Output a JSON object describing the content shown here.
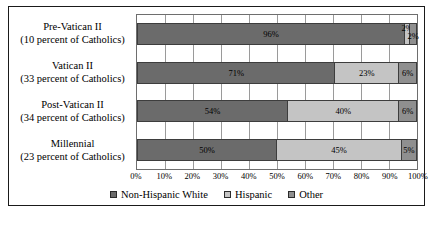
{
  "chart_data": {
    "type": "bar",
    "orientation": "horizontal",
    "stacked": true,
    "normalized_percent": true,
    "title": "",
    "subtitle": "",
    "xlabel": "",
    "ylabel": "",
    "xlim": [
      0,
      100
    ],
    "grid": true,
    "legend_position": "bottom",
    "categories": [
      "Pre-Vatican II",
      "Vatican II",
      "Post-Vatican II",
      "Millennial"
    ],
    "category_sublabels": [
      "(10 percent of Catholics)",
      "(33 percent of Catholics)",
      "(34 percent of Catholics)",
      "(23 percent of Catholics)"
    ],
    "series": [
      {
        "name": "Non-Hispanic White",
        "color": "#6b6b6b",
        "values": [
          96,
          71,
          54,
          50
        ],
        "labels": [
          "96%",
          "71%",
          "54%",
          "50%"
        ]
      },
      {
        "name": "Hispanic",
        "color": "#c4c4c4",
        "values": [
          2,
          23,
          40,
          45
        ],
        "labels": [
          "2%",
          "23%",
          "40%",
          "45%"
        ]
      },
      {
        "name": "Other",
        "color": "#8f8f8f",
        "values": [
          2,
          6,
          6,
          5
        ],
        "labels": [
          "2%",
          "6%",
          "6%",
          "5%"
        ]
      }
    ],
    "xticks": [
      0,
      10,
      20,
      30,
      40,
      50,
      60,
      70,
      80,
      90,
      100
    ],
    "xticklabels": [
      "0%",
      "10%",
      "20%",
      "30%",
      "40%",
      "50%",
      "60%",
      "70%",
      "80%",
      "90%",
      "100%"
    ]
  },
  "legend": {
    "items": [
      {
        "label": "Non-Hispanic White",
        "color": "#6b6b6b"
      },
      {
        "label": "Hispanic",
        "color": "#c4c4c4"
      },
      {
        "label": "Other",
        "color": "#8f8f8f"
      }
    ]
  }
}
